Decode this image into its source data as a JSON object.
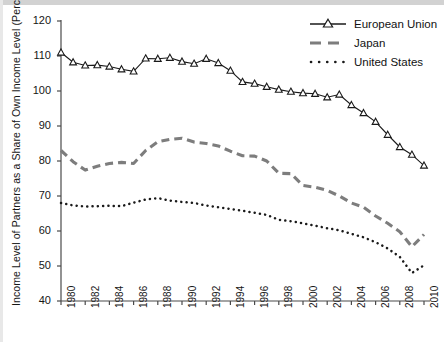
{
  "chart_data": {
    "type": "line",
    "title": "",
    "xlabel": "",
    "ylabel": "Income Level of Partners as a Share of Own Income Level (Percent)",
    "xlim": [
      1980,
      2010
    ],
    "ylim": [
      40,
      120
    ],
    "yticks": [
      40,
      50,
      60,
      70,
      80,
      90,
      100,
      110,
      120
    ],
    "xticks": [
      1980,
      1982,
      1984,
      1986,
      1988,
      1990,
      1992,
      1994,
      1996,
      1998,
      2000,
      2002,
      2004,
      2006,
      2008,
      2010
    ],
    "xtick_labels": [
      "1980",
      "1982",
      "1984",
      "1986",
      "1988",
      "1990",
      "1992",
      "1994",
      "1996",
      "1998",
      "2000",
      "2002",
      "2004",
      "2006",
      "2008",
      "2010"
    ],
    "ytick_labels": [
      "40",
      "50",
      "60",
      "70",
      "80",
      "90",
      "100",
      "110",
      "120"
    ],
    "grid": false,
    "legend_position": "top-right",
    "x": [
      1980,
      1981,
      1982,
      1983,
      1984,
      1985,
      1986,
      1987,
      1988,
      1989,
      1990,
      1991,
      1992,
      1993,
      1994,
      1995,
      1996,
      1997,
      1998,
      1999,
      2000,
      2001,
      2002,
      2003,
      2004,
      2005,
      2006,
      2007,
      2008,
      2009,
      2010
    ],
    "series": [
      {
        "name": "European Union",
        "style": "solid-with-triangle-markers",
        "color": "#1a1a1a",
        "values": [
          111.0,
          108.2,
          107.3,
          107.4,
          107.0,
          106.2,
          105.6,
          109.3,
          109.2,
          109.5,
          108.4,
          107.8,
          109.2,
          108.0,
          105.8,
          102.6,
          102.1,
          101.2,
          100.4,
          99.8,
          99.4,
          99.2,
          98.2,
          99.0,
          96.0,
          93.7,
          91.2,
          87.5,
          84.0,
          81.8,
          78.7
        ]
      },
      {
        "name": "Japan",
        "style": "dashed",
        "color": "#7d7d7d",
        "values": [
          83.0,
          79.8,
          77.4,
          78.5,
          79.3,
          79.6,
          79.3,
          83.0,
          85.5,
          86.2,
          86.5,
          85.4,
          85.0,
          84.3,
          82.8,
          81.5,
          81.4,
          80.0,
          76.5,
          76.4,
          73.0,
          72.5,
          71.6,
          70.0,
          68.0,
          66.8,
          64.3,
          62.2,
          59.8,
          55.5,
          59.0
        ]
      },
      {
        "name": "United States",
        "style": "dotted",
        "color": "#1a1a1a",
        "values": [
          68.0,
          67.3,
          67.0,
          67.1,
          67.2,
          67.1,
          68.1,
          69.0,
          69.4,
          68.7,
          68.3,
          68.0,
          67.3,
          66.8,
          66.3,
          65.8,
          65.2,
          64.6,
          63.2,
          62.8,
          62.2,
          61.5,
          60.8,
          60.2,
          59.2,
          58.2,
          56.8,
          55.0,
          52.6,
          48.0,
          50.2
        ]
      }
    ]
  },
  "legend": {
    "items": [
      {
        "label": "European Union"
      },
      {
        "label": "Japan"
      },
      {
        "label": "United States"
      }
    ]
  },
  "axes": {
    "y_axis_title": "Income Level of Partners as a Share of Own Income Level (Percent)"
  }
}
